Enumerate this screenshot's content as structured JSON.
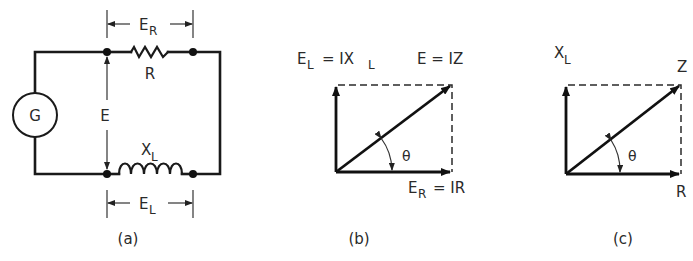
{
  "figure": {
    "panel_a": {
      "caption": "(a)",
      "generator_label": "G",
      "resistor_label": "R",
      "inductor_label_main": "X",
      "inductor_label_sub": "L",
      "source_voltage_label": "E",
      "resistor_voltage_main": "E",
      "resistor_voltage_sub": "R",
      "inductor_voltage_main": "E",
      "inductor_voltage_sub": "L"
    },
    "panel_b": {
      "caption": "(b)",
      "vertical_label_main": "E",
      "vertical_label_sub": "L",
      "vertical_label_eq": "= IX",
      "vertical_label_eq_sub": "L",
      "hypotenuse_label": "E = IZ",
      "horizontal_label_main": "E",
      "horizontal_label_sub": "R",
      "horizontal_label_eq": "= IR",
      "angle_label": "θ"
    },
    "panel_c": {
      "caption": "(c)",
      "vertical_label_main": "X",
      "vertical_label_sub": "L",
      "hypotenuse_label": "Z",
      "horizontal_label": "R",
      "angle_label": "θ"
    }
  }
}
